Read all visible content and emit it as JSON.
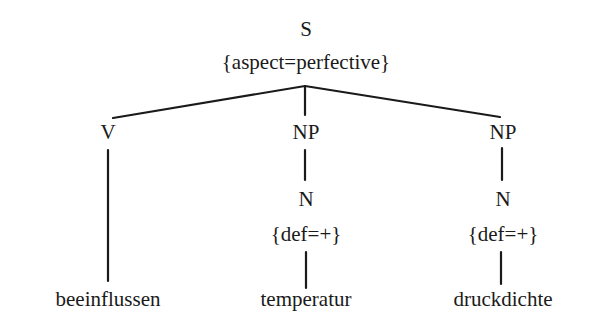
{
  "tree": {
    "root": {
      "label": "S",
      "features": "{aspect=perfective}"
    },
    "children": [
      {
        "label": "V",
        "leaf": "beeinflussen"
      },
      {
        "label": "NP",
        "child": {
          "label": "N",
          "features": "{def=+}",
          "leaf": "temperatur"
        }
      },
      {
        "label": "NP",
        "child": {
          "label": "N",
          "features": "{def=+}",
          "leaf": "druckdichte"
        }
      }
    ]
  },
  "colors": {
    "line": "#1a1a1a",
    "text": "#1a1a1a",
    "background": "#ffffff"
  }
}
